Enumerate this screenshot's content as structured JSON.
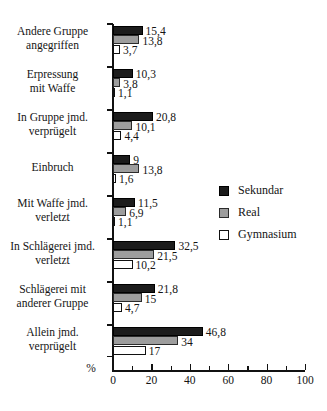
{
  "chart_data": {
    "type": "bar",
    "orientation": "horizontal",
    "title": "",
    "subtitle": "",
    "xlabel": "%",
    "ylabel": "",
    "xlim": [
      0,
      100
    ],
    "xticks": [
      0,
      20,
      40,
      60,
      80,
      100
    ],
    "xtick_labels": [
      "0",
      "20",
      "40",
      "60",
      "80",
      "100"
    ],
    "minor_xticks": [
      10,
      30,
      50,
      70,
      90
    ],
    "grid": false,
    "legend_position": "right-middle",
    "categories": [
      "Andere Gruppe angegriffen",
      "Erpressung mit Waffe",
      "In Gruppe jmd. verprügelt",
      "Einbruch",
      "Mit Waffe jmd. verletzt",
      "In Schlägerei jmd. verletzt",
      "Schlägerei mit anderer Gruppe",
      "Allein jmd. verprügelt"
    ],
    "category_lines": [
      [
        "Andere Gruppe",
        "angegriffen"
      ],
      [
        "Erpressung",
        "mit Waffe"
      ],
      [
        "In Gruppe jmd.",
        "verprügelt"
      ],
      [
        "Einbruch"
      ],
      [
        "Mit Waffe jmd.",
        "verletzt"
      ],
      [
        "In Schlägerei jmd.",
        "verletzt"
      ],
      [
        "Schlägerei mit",
        "anderer Gruppe"
      ],
      [
        "Allein jmd.",
        "verprügelt"
      ]
    ],
    "series": [
      {
        "name": "Sekundar",
        "color": "#1c1c1c",
        "values": [
          15.4,
          10.3,
          20.8,
          9,
          11.5,
          32.5,
          21.8,
          46.8
        ],
        "labels": [
          "15,4",
          "10,3",
          "20,8",
          "9",
          "11,5",
          "32,5",
          "21,8",
          "46,8"
        ]
      },
      {
        "name": "Real",
        "color": "#9d9d9d",
        "values": [
          13.8,
          3.8,
          10.1,
          13.8,
          6.9,
          21.5,
          15,
          34
        ],
        "labels": [
          "13,8",
          "3,8",
          "10,1",
          "13,8",
          "6,9",
          "21,5",
          "15",
          "34"
        ]
      },
      {
        "name": "Gymnasium",
        "color": "#ffffff",
        "values": [
          3.7,
          1.1,
          4.4,
          1.6,
          1.1,
          10.2,
          4.7,
          17
        ],
        "labels": [
          "3,7",
          "1,1",
          "4,4",
          "1,6",
          "1,1",
          "10,2",
          "4,7",
          "17"
        ]
      }
    ]
  }
}
